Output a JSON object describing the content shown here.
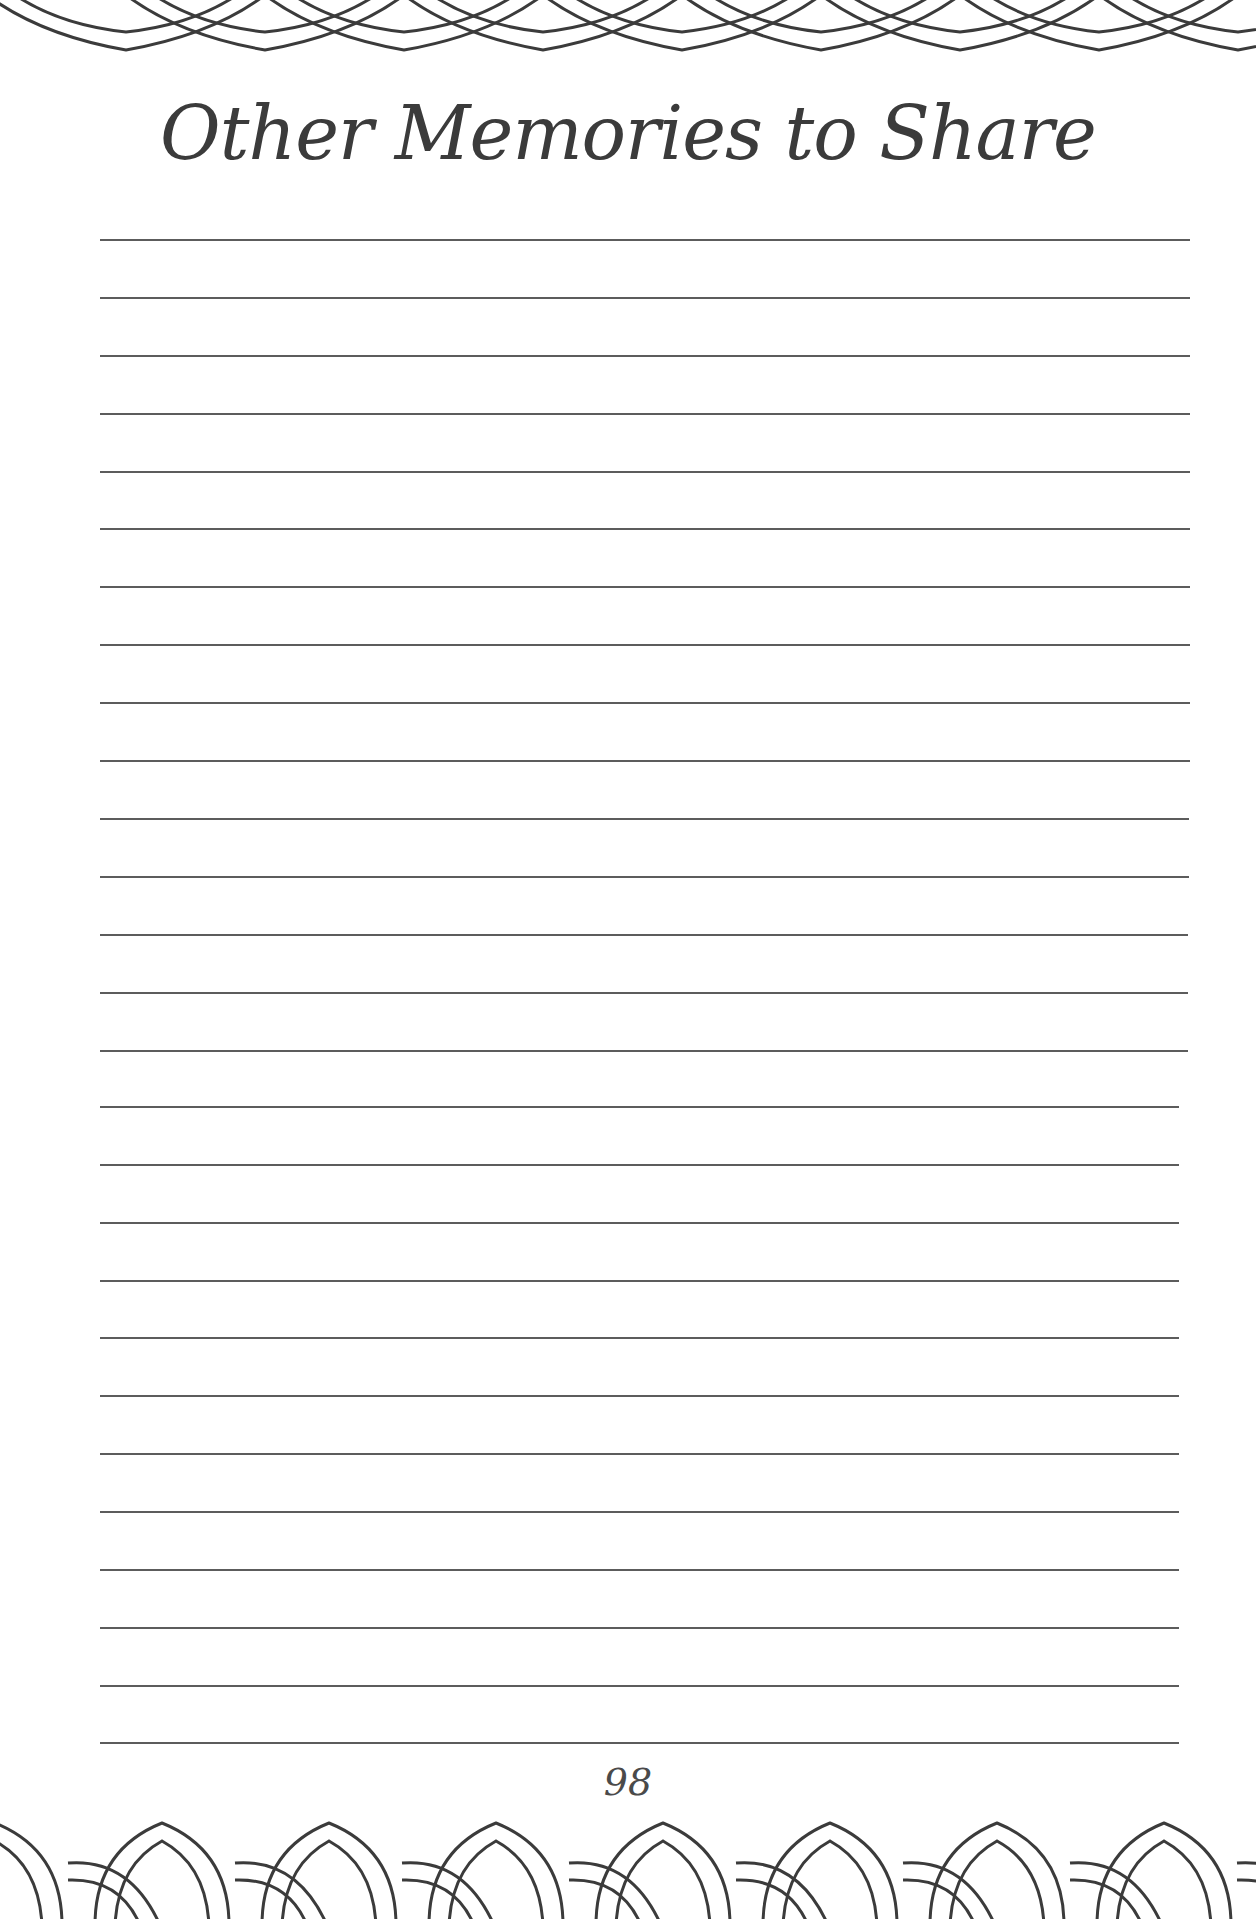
{
  "page": {
    "title": "Other Memories to Share",
    "page_number": "98",
    "line_count": 27,
    "ink_color": "#3b3b3b",
    "background_color": "#ffffff"
  },
  "decorations": {
    "top_border": "interlocking-arches-border",
    "bottom_border": "interlocking-rings-border"
  }
}
